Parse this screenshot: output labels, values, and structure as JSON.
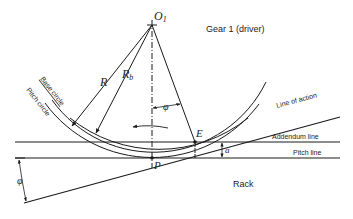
{
  "title": "Gear 1 (driver)",
  "labels": {
    "center": "O",
    "center_sub": "1",
    "pitch_radius": "R",
    "base_radius": "R",
    "base_radius_sub": "b",
    "base_circle": "Base circle",
    "pitch_circle": "Pitch circle",
    "line_of_action": "Line of action",
    "addendum_line": "Addendum line",
    "pitch_line": "Pitch line",
    "rack": "Rack",
    "pitch_point": "P",
    "contact_point": "E",
    "addendum": "a",
    "pressure_angle_top": "φ",
    "pressure_angle_left": "φ"
  },
  "colors": {
    "line": "#1a1a1a",
    "background": "#ffffff"
  }
}
